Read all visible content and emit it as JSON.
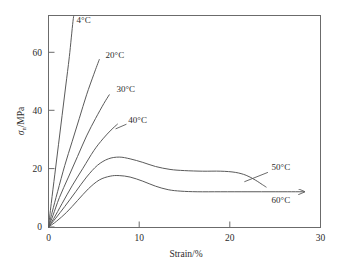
{
  "chart_data": {
    "type": "line",
    "title": "",
    "xlabel": "Strain/%",
    "ylabel": "σn/MPa",
    "ylabel_symbol": "σ",
    "ylabel_subscript": "n",
    "ylabel_unit": "/MPa",
    "xlim": [
      0,
      30
    ],
    "ylim": [
      0,
      72
    ],
    "xticks": [
      0,
      10,
      20,
      30
    ],
    "yticks": [
      0,
      20,
      40,
      60
    ],
    "xtick_labels": [
      "0",
      "10",
      "20",
      "30"
    ],
    "ytick_labels": [
      "0",
      "20",
      "40",
      "60"
    ],
    "grid": false,
    "legend": "inline-annotations",
    "line_color": "#5a5a5a",
    "frame_color": "#6b6b6b",
    "series": [
      {
        "name": "4°C",
        "label": "4°C",
        "points": [
          [
            0,
            0
          ],
          [
            0.3,
            8
          ],
          [
            0.7,
            18
          ],
          [
            1.1,
            28
          ],
          [
            1.5,
            38
          ],
          [
            1.9,
            48
          ],
          [
            2.3,
            58
          ],
          [
            2.7,
            70
          ],
          [
            2.9,
            74
          ]
        ]
      },
      {
        "name": "20°C",
        "label": "20°C",
        "points": [
          [
            0,
            0
          ],
          [
            0.4,
            5
          ],
          [
            1.0,
            12
          ],
          [
            1.8,
            21
          ],
          [
            2.6,
            29
          ],
          [
            3.4,
            37
          ],
          [
            4.2,
            45
          ],
          [
            5.0,
            52
          ],
          [
            5.6,
            57
          ]
        ]
      },
      {
        "name": "30°C",
        "label": "30°C",
        "points": [
          [
            0,
            0
          ],
          [
            0.5,
            4
          ],
          [
            1.2,
            10
          ],
          [
            2.2,
            17
          ],
          [
            3.2,
            24
          ],
          [
            4.2,
            31
          ],
          [
            5.2,
            37
          ],
          [
            6.1,
            42
          ],
          [
            6.7,
            45
          ]
        ]
      },
      {
        "name": "40°C",
        "label": "40°C",
        "points": [
          [
            0,
            0
          ],
          [
            0.6,
            3
          ],
          [
            1.5,
            8
          ],
          [
            2.6,
            14
          ],
          [
            3.8,
            20
          ],
          [
            5.0,
            26
          ],
          [
            6.0,
            30
          ],
          [
            6.9,
            33
          ],
          [
            7.6,
            35
          ]
        ]
      },
      {
        "name": "50°C",
        "label": "50°C",
        "points": [
          [
            0,
            0
          ],
          [
            0.8,
            3
          ],
          [
            1.8,
            7
          ],
          [
            3.0,
            12
          ],
          [
            4.2,
            17
          ],
          [
            5.4,
            21
          ],
          [
            6.6,
            23.2
          ],
          [
            7.8,
            23.8
          ],
          [
            9.0,
            23.2
          ],
          [
            10.4,
            22.0
          ],
          [
            11.8,
            20.6
          ],
          [
            13.4,
            19.6
          ],
          [
            15.0,
            19.2
          ],
          [
            17.0,
            19.0
          ],
          [
            19.0,
            19.0
          ],
          [
            20.6,
            18.6
          ],
          [
            21.8,
            17.6
          ],
          [
            22.8,
            16.0
          ],
          [
            23.6,
            14.4
          ],
          [
            24.0,
            13.6
          ]
        ]
      },
      {
        "name": "60°C",
        "label": "60°C",
        "points": [
          [
            0,
            0
          ],
          [
            0.9,
            2
          ],
          [
            2.0,
            5
          ],
          [
            3.2,
            9
          ],
          [
            4.4,
            13
          ],
          [
            5.6,
            16
          ],
          [
            6.8,
            17.3
          ],
          [
            7.8,
            17.5
          ],
          [
            9.0,
            17.0
          ],
          [
            10.4,
            15.6
          ],
          [
            11.8,
            13.9
          ],
          [
            13.2,
            12.7
          ],
          [
            14.6,
            12.2
          ],
          [
            16.4,
            12.0
          ],
          [
            19.0,
            12.0
          ],
          [
            22.0,
            12.0
          ],
          [
            25.0,
            12.0
          ],
          [
            28.2,
            12.0
          ]
        ],
        "arrow_end": true
      }
    ],
    "annotations": [
      {
        "text": "4°C",
        "x": 3.1,
        "y": 69.5,
        "leader": false
      },
      {
        "text": "20°C",
        "x": 6.3,
        "y": 57.5,
        "leader": false
      },
      {
        "text": "30°C",
        "x": 7.5,
        "y": 46.0,
        "leader": false
      },
      {
        "text": "40°C",
        "x": 8.8,
        "y": 35.5,
        "leader": true
      },
      {
        "text": "50°C",
        "x": 24.6,
        "y": 19.4,
        "leader": true
      },
      {
        "text": "60°C",
        "x": 24.6,
        "y": 8.2,
        "leader": false
      }
    ]
  }
}
